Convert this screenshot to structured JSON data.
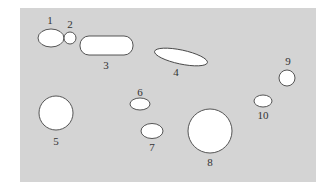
{
  "diagram": {
    "background_color": "#ffffff",
    "panel": {
      "x": 20,
      "y": 8,
      "width": 296,
      "height": 174,
      "color": "#d4d4d4"
    },
    "shapes": [
      {
        "id": "1",
        "label": "1",
        "type": "ellipse",
        "cx": 51,
        "cy": 38,
        "rx": 13,
        "ry": 9,
        "rotate": 0,
        "label_x": 50,
        "label_y": 24
      },
      {
        "id": "2",
        "label": "2",
        "type": "ellipse",
        "cx": 70,
        "cy": 38,
        "rx": 6,
        "ry": 6,
        "rotate": 0,
        "label_x": 70,
        "label_y": 28
      },
      {
        "id": "3",
        "label": "3",
        "type": "rect",
        "x": 80,
        "y": 36,
        "w": 53,
        "h": 19,
        "r": 9,
        "rotate": 0,
        "label_x": 106,
        "label_y": 69
      },
      {
        "id": "4",
        "label": "4",
        "type": "ellipse",
        "cx": 181,
        "cy": 57,
        "rx": 27,
        "ry": 7,
        "rotate": 12,
        "label_x": 176,
        "label_y": 76
      },
      {
        "id": "5",
        "label": "5",
        "type": "ellipse",
        "cx": 56,
        "cy": 113,
        "rx": 17,
        "ry": 17,
        "rotate": 0,
        "label_x": 56,
        "label_y": 145
      },
      {
        "id": "6",
        "label": "6",
        "type": "ellipse",
        "cx": 140,
        "cy": 104,
        "rx": 10,
        "ry": 6,
        "rotate": 0,
        "label_x": 140,
        "label_y": 96
      },
      {
        "id": "7",
        "label": "7",
        "type": "ellipse",
        "cx": 152,
        "cy": 131,
        "rx": 11,
        "ry": 7.5,
        "rotate": 0,
        "label_x": 152,
        "label_y": 151
      },
      {
        "id": "8",
        "label": "8",
        "type": "ellipse",
        "cx": 210,
        "cy": 131,
        "rx": 22,
        "ry": 22,
        "rotate": 0,
        "label_x": 210,
        "label_y": 166
      },
      {
        "id": "9",
        "label": "9",
        "type": "ellipse",
        "cx": 287,
        "cy": 78,
        "rx": 8,
        "ry": 8,
        "rotate": 0,
        "label_x": 288,
        "label_y": 65
      },
      {
        "id": "10",
        "label": "10",
        "type": "ellipse",
        "cx": 263,
        "cy": 101,
        "rx": 9,
        "ry": 6,
        "rotate": 0,
        "label_x": 263,
        "label_y": 119
      }
    ]
  }
}
